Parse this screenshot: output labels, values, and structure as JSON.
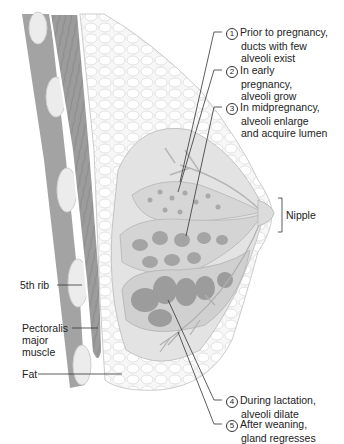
{
  "figure": {
    "type": "anatomical-diagram"
  },
  "labels": {
    "left": [
      {
        "id": "rib",
        "text": "5th rib"
      },
      {
        "id": "pectoralis",
        "lines": [
          "Pectoralis",
          "major",
          "muscle"
        ]
      },
      {
        "id": "fat",
        "text": "Fat"
      }
    ],
    "right": [
      {
        "id": "nipple",
        "text": "Nipple"
      }
    ]
  },
  "stages": [
    {
      "number": "1",
      "lines": [
        "Prior to pregnancy,",
        "ducts with few",
        "alveoli exist"
      ]
    },
    {
      "number": "2",
      "lines": [
        "In early",
        "pregnancy,",
        "alveoli grow"
      ]
    },
    {
      "number": "3",
      "lines": [
        "In midpregnancy,",
        "alveoli enlarge",
        "and acquire lumen"
      ]
    },
    {
      "number": "4",
      "lines": [
        "During lactation,",
        "alveoli dilate"
      ]
    },
    {
      "number": "5",
      "lines": [
        "After weaning,",
        "gland regresses"
      ]
    }
  ],
  "colors": {
    "muscle": "#9a9a9a",
    "rib": "#e6e6e6",
    "fat": "#f2f2f2",
    "lobule": "#c8c8c8",
    "alveoli": "#a8a8a8",
    "leader": "#333333"
  }
}
